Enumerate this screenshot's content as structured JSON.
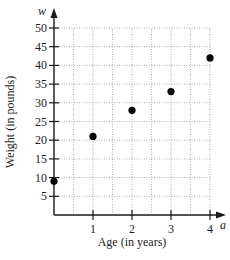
{
  "chart_data": {
    "type": "scatter",
    "title": "",
    "xlabel": "Age (in years)",
    "ylabel": "Weight (in pounds)",
    "x_var": "a",
    "y_var": "w",
    "x_ticks": [
      1,
      2,
      3,
      4
    ],
    "y_ticks": [
      5,
      10,
      15,
      20,
      25,
      30,
      35,
      40,
      45,
      50
    ],
    "xlim": [
      0,
      4
    ],
    "ylim": [
      0,
      50
    ],
    "grid": true,
    "grid_x_step": 0.5,
    "grid_y_step": 5,
    "series": [
      {
        "name": "Weight",
        "points": [
          {
            "x": 0,
            "y": 9
          },
          {
            "x": 1,
            "y": 21
          },
          {
            "x": 2,
            "y": 28
          },
          {
            "x": 3,
            "y": 33
          },
          {
            "x": 4,
            "y": 42
          }
        ]
      }
    ],
    "colors": {
      "axis": "#1a1a1a",
      "grid": "#9a9a9a",
      "point": "#000000"
    }
  }
}
